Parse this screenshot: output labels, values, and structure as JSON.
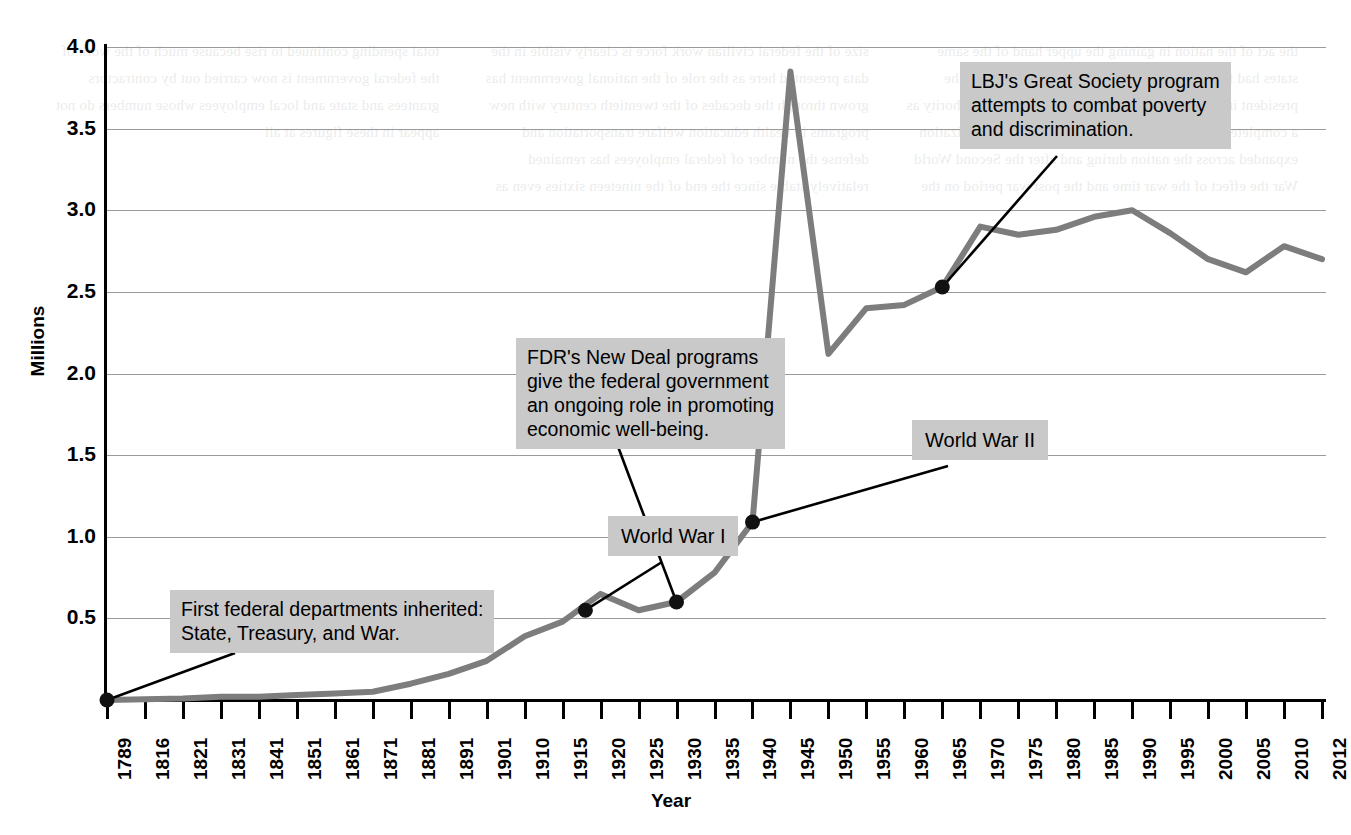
{
  "chart_data": {
    "type": "line",
    "title": "",
    "xlabel": "Year",
    "ylabel": "Millions",
    "ylim": [
      0,
      4.0
    ],
    "grid": true,
    "legend": "none",
    "units": "Millions of federal civilian employees",
    "y_ticks": [
      "0.5",
      "1.0",
      "1.5",
      "2.0",
      "2.5",
      "3.0",
      "3.5",
      "4.0"
    ],
    "y_tick_values": [
      0.5,
      1.0,
      1.5,
      2.0,
      2.5,
      3.0,
      3.5,
      4.0
    ],
    "categories": [
      "1789",
      "1816",
      "1821",
      "1831",
      "1841",
      "1851",
      "1861",
      "1871",
      "1881",
      "1891",
      "1901",
      "1910",
      "1915",
      "1920",
      "1925",
      "1930",
      "1935",
      "1940",
      "1945",
      "1950",
      "1955",
      "1960",
      "1965",
      "1970",
      "1975",
      "1980",
      "1985",
      "1990",
      "1995",
      "2000",
      "2005",
      "2010",
      "2012"
    ],
    "values": [
      0.0,
      0.005,
      0.01,
      0.02,
      0.02,
      0.03,
      0.04,
      0.05,
      0.1,
      0.16,
      0.24,
      0.39,
      0.48,
      0.65,
      0.55,
      0.6,
      0.78,
      1.09,
      3.85,
      2.12,
      2.4,
      2.42,
      2.53,
      2.9,
      2.85,
      2.88,
      2.96,
      3.0,
      2.86,
      2.7,
      2.62,
      2.78,
      2.7
    ],
    "line_color": "#7d7d7d",
    "marker_color": "#111111",
    "gridline_color": "#9a9a9a",
    "marked_points": [
      {
        "year": "1789",
        "value": 0.0
      },
      {
        "year": "1918",
        "value": 0.55
      },
      {
        "year": "1930",
        "value": 0.6
      },
      {
        "year": "1940",
        "value": 1.09
      },
      {
        "year": "1965",
        "value": 2.53
      }
    ],
    "annotations": [
      {
        "id": "first-departments",
        "text": "First federal departments inherited:\nState, Treasury, and War.",
        "points_to_year": "1789"
      },
      {
        "id": "world-war-1",
        "text": "World War I",
        "points_to_year": "1918"
      },
      {
        "id": "fdr-new-deal",
        "text": "FDR's New Deal programs\ngive the federal government\nan ongoing role in promoting\neconomic well-being.",
        "points_to_year": "1930"
      },
      {
        "id": "world-war-2",
        "text": "World War II",
        "points_to_year": "1940"
      },
      {
        "id": "lbj-great-society",
        "text": "LBJ's Great Society program\nattempts to combat poverty\nand discrimination.",
        "points_to_year": "1965"
      }
    ]
  },
  "axes": {
    "y_title": "Millions",
    "x_title": "Year"
  },
  "background_text": "the act of the nation in gaining the upper hand of the same states had formed the federal system of the union and the president in acting and following the states in their authority as a complete and ongoing measure of government organization expanded across the nation during and after the Second World War the effect of the war time and the post war period on the size of the federal civilian work force is clearly visible in the data presented here as the role of the national government has grown through the decades of the twentieth century with new programs in health education welfare transportation and defense the number of federal employees has remained relatively stable since the end of the nineteen sixties even as total spending continued to rise because much of the work of the federal government is now carried out by contractors grantees and state and local employees whose numbers do not appear in these figures at all"
}
